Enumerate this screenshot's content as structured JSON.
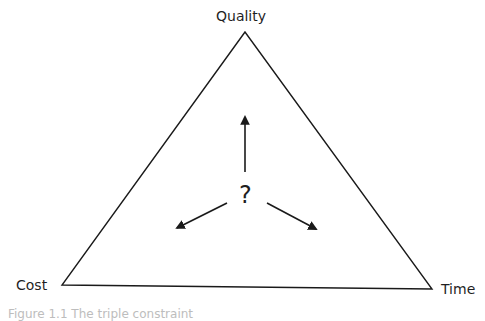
{
  "diagram": {
    "type": "project-management-triangle",
    "vertices": {
      "top": {
        "label": "Quality"
      },
      "bottom_left": {
        "label": "Cost"
      },
      "bottom_right": {
        "label": "Time"
      }
    },
    "center_symbol": "?",
    "arrows": [
      "up",
      "down-left",
      "down-right"
    ],
    "line_color": "#1a1a1a"
  },
  "caption": "Figure 1.1 The triple constraint"
}
